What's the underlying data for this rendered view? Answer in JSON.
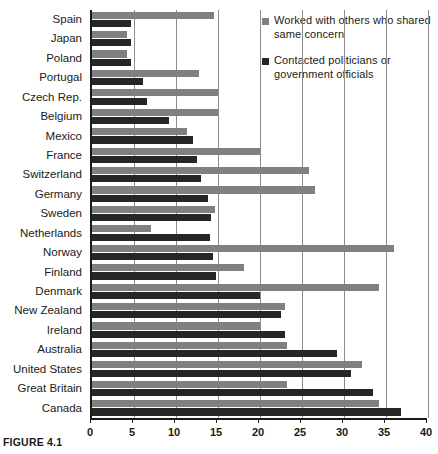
{
  "caption": "FIGURE 4.1",
  "colors": {
    "series_a": "#808080",
    "series_b": "#262626",
    "axis": "#1a1a1a",
    "grid": "#8d8d8d",
    "background": "#ffffff"
  },
  "legend": {
    "position": "top-right",
    "entries": [
      {
        "label": "Worked with others who shared same concern",
        "color": "#808080",
        "swatch_icon": "square-swatch-icon"
      },
      {
        "label": "Contacted politicians or government officials",
        "color": "#262626",
        "swatch_icon": "square-swatch-icon"
      }
    ]
  },
  "chart_data": {
    "type": "bar",
    "orientation": "horizontal",
    "title": "",
    "xlabel": "",
    "ylabel": "",
    "xlim": [
      0,
      40
    ],
    "xticks": [
      0,
      5,
      10,
      15,
      20,
      25,
      30,
      35,
      40
    ],
    "grid": true,
    "grid_axis": "x",
    "legend_position": "top-right",
    "categories": [
      "Spain",
      "Japan",
      "Poland",
      "Portugal",
      "Czech Rep.",
      "Belgium",
      "Mexico",
      "France",
      "Switzerland",
      "Germany",
      "Sweden",
      "Netherlands",
      "Norway",
      "Finland",
      "Denmark",
      "New Zealand",
      "Ireland",
      "Australia",
      "United States",
      "Great Britain",
      "Canada"
    ],
    "series": [
      {
        "name": "Worked with others who shared same concern",
        "color": "#808080",
        "values": [
          14.5,
          4.2,
          4.2,
          12.7,
          15.0,
          15.0,
          11.3,
          20.0,
          25.8,
          26.5,
          14.6,
          7.0,
          36.0,
          18.1,
          34.2,
          23.0,
          20.0,
          23.2,
          32.2,
          23.2,
          34.2
        ]
      },
      {
        "name": "Contacted politicians or government officials",
        "color": "#262626",
        "values": [
          4.6,
          4.6,
          4.6,
          6.1,
          6.6,
          9.2,
          12.0,
          12.5,
          13.0,
          13.8,
          14.2,
          14.0,
          14.4,
          14.8,
          20.0,
          22.5,
          23.0,
          29.2,
          30.8,
          33.5,
          36.8
        ]
      }
    ]
  }
}
